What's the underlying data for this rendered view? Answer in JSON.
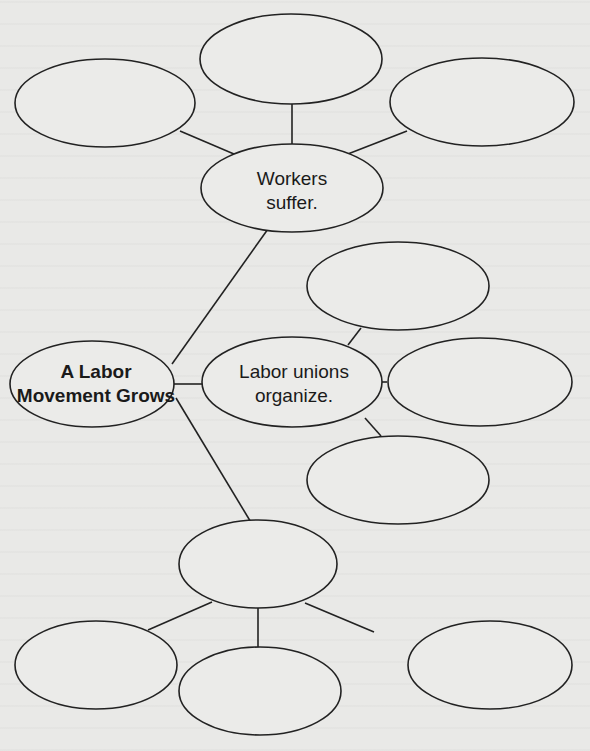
{
  "diagram": {
    "type": "web-organizer",
    "root": {
      "id": "main",
      "line1": "A Labor",
      "line2": "Movement Grows"
    },
    "branches": [
      {
        "id": "workers",
        "line1": "Workers",
        "line2": "suffer.",
        "children": [
          "",
          "",
          ""
        ]
      },
      {
        "id": "unions",
        "line1": "Labor unions",
        "line2": "organize.",
        "children": [
          "",
          "",
          ""
        ]
      },
      {
        "id": "third",
        "line1": "",
        "line2": "",
        "children": [
          "",
          "",
          ""
        ]
      }
    ]
  }
}
